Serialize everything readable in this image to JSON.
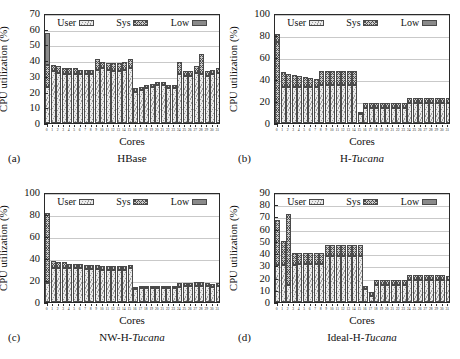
{
  "figure": {
    "legend": [
      {
        "key": "user",
        "label": "User",
        "swatch": "hatch-light"
      },
      {
        "key": "sys",
        "label": "Sys",
        "swatch": "crosshatch"
      },
      {
        "key": "low",
        "label": "Low",
        "swatch": "solid-gray"
      }
    ],
    "colors": {
      "user": "#ebebeb",
      "sys": "#c9c9c9",
      "low": "#8a8a8a",
      "axis": "#2a2a2a",
      "grid": "#c9c9c9",
      "background": "#ffffff"
    },
    "xlabel": "Cores",
    "ylabel": "CPU utilization (%)"
  },
  "panels": [
    {
      "tag": "(a)",
      "caption_plain": "HBase",
      "caption_pre": "HBase",
      "caption_italic": "",
      "caption_post": ""
    },
    {
      "tag": "(b)",
      "caption_plain": "H-Tucana",
      "caption_pre": "H-",
      "caption_italic": "Tucana",
      "caption_post": ""
    },
    {
      "tag": "(c)",
      "caption_plain": "NW-H-Tucana",
      "caption_pre": "NW-H-",
      "caption_italic": "Tucana",
      "caption_post": ""
    },
    {
      "tag": "(d)",
      "caption_plain": "Ideal-H-Tucana",
      "caption_pre": "Ideal-H-",
      "caption_italic": "Tucana",
      "caption_post": ""
    }
  ],
  "chart_data": [
    {
      "type": "bar",
      "stacked": true,
      "panel": "(a)",
      "title": "HBase",
      "xlabel": "Cores",
      "ylabel": "CPU utilization (%)",
      "ylim": [
        0,
        70
      ],
      "yticks": [
        0,
        10,
        20,
        30,
        40,
        50,
        60,
        70
      ],
      "grid": true,
      "legend_position": "top-inside",
      "categories": [
        "0",
        "1",
        "2",
        "3",
        "4",
        "5",
        "6",
        "7",
        "8",
        "9",
        "10",
        "11",
        "12",
        "13",
        "14",
        "15",
        "16",
        "17",
        "18",
        "19",
        "20",
        "21",
        "22",
        "23",
        "24",
        "25",
        "26",
        "27",
        "28",
        "29",
        "30",
        "31"
      ],
      "series": [
        {
          "name": "User",
          "values": [
            23,
            33,
            32,
            31,
            31,
            31,
            31,
            31,
            31,
            34,
            35,
            34,
            33,
            33,
            34,
            35,
            20,
            21,
            22,
            23,
            24,
            24,
            22,
            22,
            31,
            30,
            30,
            32,
            31,
            30,
            31,
            32
          ]
        },
        {
          "name": "Sys",
          "values": [
            14,
            4,
            4,
            4,
            4,
            4,
            3,
            3,
            3,
            7,
            4,
            4,
            5,
            5,
            5,
            6,
            2,
            2,
            2,
            2,
            2,
            2,
            2,
            2,
            8,
            3,
            3,
            4,
            13,
            3,
            3,
            3
          ]
        },
        {
          "name": "Low",
          "values": [
            20,
            0,
            0,
            0,
            0,
            0,
            0,
            0,
            0,
            0,
            0,
            0,
            0,
            0,
            0,
            0,
            0,
            0,
            0,
            0,
            0,
            0,
            0,
            0,
            0,
            0,
            0,
            0,
            0,
            0,
            0,
            0
          ]
        }
      ],
      "tops": [
        57,
        37,
        36,
        35,
        35,
        35,
        34,
        34,
        34,
        41,
        39,
        38,
        38,
        38,
        39,
        41,
        22,
        23,
        24,
        25,
        26,
        26,
        24,
        24,
        39,
        33,
        33,
        36,
        44,
        33,
        34,
        35
      ]
    },
    {
      "type": "bar",
      "stacked": true,
      "panel": "(b)",
      "title": "H-Tucana",
      "xlabel": "Cores",
      "ylabel": "CPU utilization (%)",
      "ylim": [
        0,
        100
      ],
      "yticks": [
        0,
        20,
        40,
        60,
        80,
        100
      ],
      "grid": true,
      "legend_position": "top-inside",
      "categories": [
        "0",
        "1",
        "2",
        "3",
        "4",
        "5",
        "6",
        "7",
        "8",
        "9",
        "10",
        "11",
        "12",
        "13",
        "14",
        "15",
        "16",
        "17",
        "18",
        "19",
        "20",
        "21",
        "22",
        "23",
        "24",
        "25",
        "26",
        "27",
        "28",
        "29",
        "30",
        "31"
      ],
      "series": [
        {
          "name": "User",
          "values": [
            0,
            33,
            33,
            33,
            33,
            33,
            33,
            33,
            35,
            35,
            35,
            35,
            35,
            35,
            35,
            8,
            14,
            14,
            14,
            14,
            14,
            14,
            14,
            14,
            18,
            18,
            18,
            18,
            18,
            18,
            18,
            18
          ]
        },
        {
          "name": "Sys",
          "values": [
            81,
            13,
            12,
            11,
            10,
            9,
            8,
            7,
            12,
            12,
            12,
            12,
            12,
            12,
            12,
            1,
            4,
            4,
            4,
            4,
            4,
            4,
            4,
            4,
            5,
            5,
            5,
            5,
            5,
            5,
            5,
            5
          ]
        },
        {
          "name": "Low",
          "values": [
            0,
            0,
            0,
            0,
            0,
            0,
            0,
            0,
            0,
            0,
            0,
            0,
            0,
            0,
            0,
            0,
            0,
            0,
            0,
            0,
            0,
            0,
            0,
            0,
            0,
            0,
            0,
            0,
            0,
            0,
            0,
            0
          ]
        }
      ],
      "tops": [
        81,
        46,
        45,
        44,
        43,
        42,
        41,
        40,
        47,
        47,
        47,
        47,
        47,
        47,
        47,
        9,
        18,
        18,
        18,
        18,
        18,
        18,
        18,
        18,
        23,
        23,
        23,
        23,
        23,
        23,
        23,
        23
      ]
    },
    {
      "type": "bar",
      "stacked": true,
      "panel": "(c)",
      "title": "NW-H-Tucana",
      "xlabel": "Cores",
      "ylabel": "CPU utilization (%)",
      "ylim": [
        0,
        100
      ],
      "yticks": [
        0,
        20,
        40,
        60,
        80,
        100
      ],
      "grid": true,
      "legend_position": "top-inside",
      "categories": [
        "0",
        "1",
        "2",
        "3",
        "4",
        "5",
        "6",
        "7",
        "8",
        "9",
        "10",
        "11",
        "12",
        "13",
        "14",
        "15",
        "16",
        "17",
        "18",
        "19",
        "20",
        "21",
        "22",
        "23",
        "24",
        "25",
        "26",
        "27",
        "28",
        "29",
        "30",
        "31"
      ],
      "series": [
        {
          "name": "User",
          "values": [
            17,
            31,
            31,
            31,
            31,
            31,
            31,
            30,
            30,
            30,
            29,
            29,
            29,
            29,
            29,
            31,
            12,
            13,
            13,
            13,
            13,
            13,
            13,
            13,
            14,
            15,
            15,
            15,
            15,
            15,
            14,
            15
          ]
        },
        {
          "name": "Sys",
          "values": [
            64,
            6,
            5,
            5,
            4,
            4,
            4,
            4,
            4,
            4,
            4,
            4,
            4,
            4,
            4,
            3,
            1,
            2,
            2,
            2,
            2,
            2,
            2,
            2,
            3,
            2,
            2,
            3,
            3,
            2,
            2,
            2
          ]
        },
        {
          "name": "Low",
          "values": [
            0,
            0,
            0,
            0,
            0,
            0,
            0,
            0,
            0,
            0,
            0,
            0,
            0,
            0,
            0,
            0,
            0,
            0,
            0,
            0,
            0,
            0,
            0,
            0,
            0,
            0,
            0,
            0,
            0,
            0,
            0,
            0
          ]
        }
      ],
      "tops": [
        81,
        37,
        36,
        36,
        35,
        35,
        35,
        34,
        34,
        34,
        33,
        33,
        33,
        33,
        33,
        34,
        13,
        15,
        15,
        15,
        15,
        15,
        15,
        15,
        17,
        17,
        17,
        18,
        18,
        17,
        16,
        17
      ]
    },
    {
      "type": "bar",
      "stacked": true,
      "panel": "(d)",
      "title": "Ideal-H-Tucana",
      "xlabel": "Cores",
      "ylabel": "CPU utilization (%)",
      "ylim": [
        0,
        90
      ],
      "yticks": [
        0,
        10,
        20,
        30,
        40,
        50,
        60,
        70,
        80,
        90
      ],
      "grid": true,
      "legend_position": "top-inside",
      "categories": [
        "0",
        "1",
        "2",
        "3",
        "4",
        "5",
        "6",
        "7",
        "8",
        "9",
        "10",
        "11",
        "12",
        "13",
        "14",
        "15",
        "16",
        "17",
        "18",
        "19",
        "20",
        "21",
        "22",
        "23",
        "24",
        "25",
        "26",
        "27",
        "28",
        "29",
        "30",
        "31"
      ],
      "series": [
        {
          "name": "User",
          "values": [
            30,
            30,
            14,
            30,
            31,
            31,
            31,
            31,
            31,
            38,
            38,
            38,
            38,
            38,
            38,
            38,
            11,
            5,
            14,
            14,
            14,
            14,
            14,
            14,
            18,
            18,
            18,
            18,
            18,
            18,
            18,
            18
          ]
        },
        {
          "name": "Sys",
          "values": [
            37,
            20,
            58,
            10,
            9,
            9,
            9,
            9,
            9,
            9,
            9,
            9,
            9,
            9,
            9,
            9,
            2,
            3,
            4,
            4,
            4,
            4,
            4,
            4,
            4,
            4,
            4,
            4,
            4,
            4,
            4,
            3
          ]
        },
        {
          "name": "Low",
          "values": [
            0,
            0,
            0,
            0,
            0,
            0,
            0,
            0,
            0,
            0,
            0,
            0,
            0,
            0,
            0,
            0,
            0,
            0,
            0,
            0,
            0,
            0,
            0,
            0,
            0,
            0,
            0,
            0,
            0,
            0,
            0,
            0
          ]
        }
      ],
      "tops": [
        67,
        50,
        72,
        40,
        40,
        40,
        40,
        40,
        40,
        47,
        47,
        47,
        47,
        47,
        47,
        47,
        13,
        8,
        18,
        18,
        18,
        18,
        18,
        18,
        22,
        22,
        22,
        22,
        22,
        22,
        22,
        21
      ]
    }
  ]
}
